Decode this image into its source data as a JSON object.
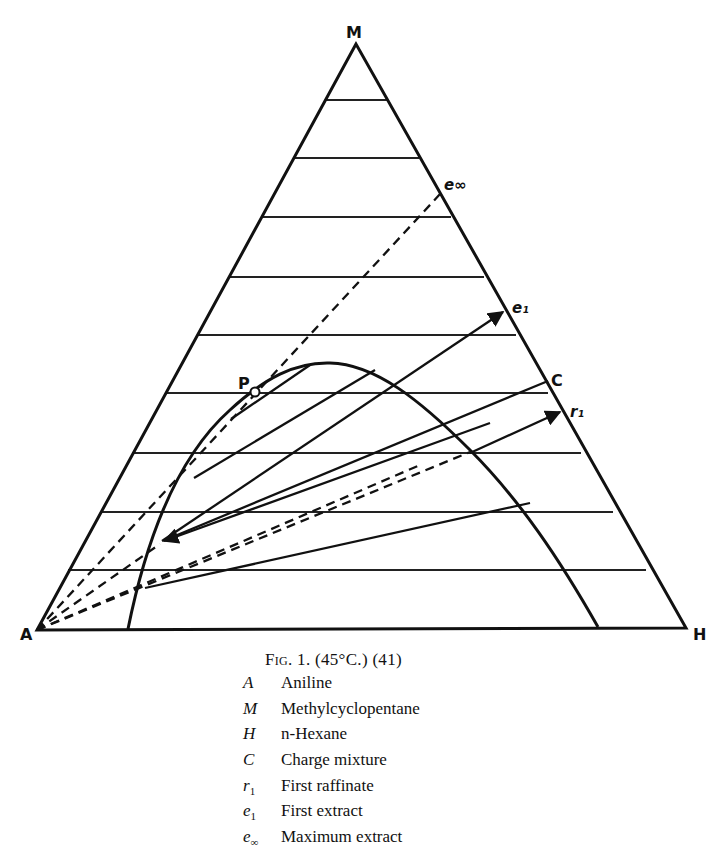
{
  "diagram": {
    "type": "ternary-phase-diagram",
    "vertices": {
      "top": {
        "label": "M",
        "x": 356,
        "y": 44
      },
      "left": {
        "label": "A",
        "x": 37,
        "y": 630
      },
      "right": {
        "label": "H",
        "x": 686,
        "y": 628
      }
    },
    "grid_lines_y": [
      100,
      158,
      217,
      277,
      335,
      393,
      453,
      512,
      570
    ],
    "plait_point": {
      "label": "P",
      "x": 255,
      "y": 392
    },
    "points": {
      "e_inf": {
        "label": "e∞",
        "x": 441,
        "y": 193
      },
      "e1": {
        "label": "e₁",
        "x": 506,
        "y": 311
      },
      "C": {
        "label": "C",
        "x": 548,
        "y": 381
      },
      "r1": {
        "label": "r₁",
        "x": 563,
        "y": 411
      }
    },
    "stroke_color": "#111111",
    "background_color": "#ffffff"
  },
  "caption": {
    "fig_label": "Fig. 1.",
    "details": "(45°C.) (41)"
  },
  "legend": [
    {
      "symbol": "A",
      "sub": "",
      "text": "Aniline"
    },
    {
      "symbol": "M",
      "sub": "",
      "text": "Methylcyclopentane"
    },
    {
      "symbol": "H",
      "sub": "",
      "text": "n-Hexane"
    },
    {
      "symbol": "C",
      "sub": "",
      "text": "Charge mixture"
    },
    {
      "symbol": "r",
      "sub": "1",
      "text": "First raffinate"
    },
    {
      "symbol": "e",
      "sub": "1",
      "text": "First extract"
    },
    {
      "symbol": "e",
      "sub": "∞",
      "text": "Maximum extract"
    }
  ]
}
